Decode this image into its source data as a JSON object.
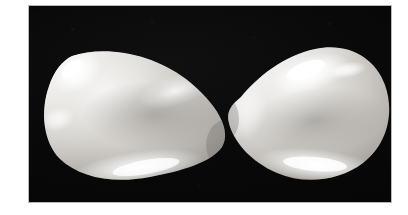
{
  "image": {
    "kind": "photograph",
    "subject": "two-eggs",
    "caption": "Two pale eggs resting on a black background, touching at their narrow ends",
    "canvas": {
      "width": 408,
      "height": 215
    },
    "background_color": "#ffffff"
  },
  "frame": {
    "name": "photo-frame",
    "border_color": "#b9b9b9",
    "border_width_px": 1,
    "x": 28,
    "y": 5,
    "width": 364,
    "height": 198,
    "backdrop_color": "#070707"
  },
  "objects": [
    {
      "name": "egg-left",
      "label": "Left egg",
      "orientation": "narrow end pointing right",
      "bounds": {
        "x": 42,
        "y": 46,
        "width": 172,
        "height": 136
      },
      "body_color": "#cfcdc9",
      "highlight_color": "#ffffff",
      "shadow_color": "#8d8b88",
      "highlights": [
        {
          "name": "specular-upper-left",
          "strength": "strong"
        },
        {
          "name": "rim-light-bottom",
          "strength": "strong"
        },
        {
          "name": "band-upper-right",
          "strength": "medium"
        }
      ]
    },
    {
      "name": "egg-right",
      "label": "Right egg",
      "orientation": "narrow end pointing left",
      "bounds": {
        "x": 208,
        "y": 38,
        "width": 172,
        "height": 150
      },
      "body_color": "#cfcdc9",
      "highlight_color": "#ffffff",
      "shadow_color": "#8d8b88",
      "highlights": [
        {
          "name": "specular-upper-center",
          "strength": "strong"
        },
        {
          "name": "rim-light-bottom",
          "strength": "strong"
        },
        {
          "name": "edge-light-left",
          "strength": "medium"
        }
      ]
    }
  ],
  "contact_point": {
    "name": "egg-contact-point",
    "x": 211,
    "y": 120
  },
  "texture": {
    "name": "halftone-scan-texture",
    "description": "fine print halftone / scanline grid over the photograph",
    "opacity": 0.22
  }
}
